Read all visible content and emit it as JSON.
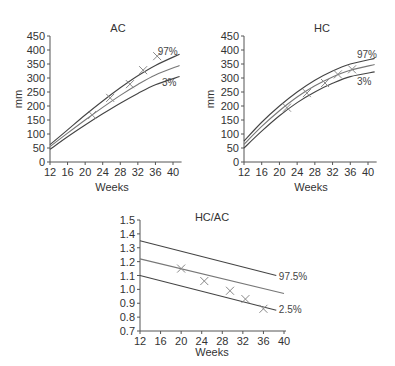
{
  "chart_data": [
    {
      "type": "line",
      "title": "AC",
      "xlabel": "Weeks",
      "ylabel": "mm",
      "xlim": [
        12,
        41.5
      ],
      "ylim": [
        0,
        450
      ],
      "x_ticks": [
        12,
        16,
        20,
        24,
        28,
        32,
        36,
        40
      ],
      "y_ticks": [
        0,
        50,
        100,
        150,
        200,
        250,
        300,
        350,
        400,
        450
      ],
      "grid": false,
      "series": [
        {
          "name": "97%",
          "x": [
            12,
            16,
            20,
            24,
            28,
            32,
            36,
            41.5
          ],
          "values": [
            62,
            115,
            168,
            218,
            265,
            308,
            345,
            385
          ]
        },
        {
          "name": "50%",
          "x": [
            12,
            16,
            20,
            24,
            28,
            32,
            36,
            41.5
          ],
          "values": [
            55,
            103,
            150,
            195,
            238,
            277,
            311,
            345
          ]
        },
        {
          "name": "3%",
          "x": [
            12,
            16,
            20,
            24,
            28,
            32,
            36,
            41.5
          ],
          "values": [
            45,
            90,
            132,
            172,
            210,
            245,
            276,
            305
          ]
        }
      ],
      "points": {
        "name": "measurements",
        "x": [
          21.6,
          25.7,
          30.2,
          33.2,
          36.4
        ],
        "values": [
          168,
          229,
          278,
          328,
          378
        ]
      },
      "annotations": [
        {
          "text": "97%",
          "x": 36.5,
          "y": 398
        },
        {
          "text": "3%",
          "x": 37.5,
          "y": 285
        }
      ]
    },
    {
      "type": "line",
      "title": "HC",
      "xlabel": "Weeks",
      "ylabel": "mm",
      "xlim": [
        12,
        41.5
      ],
      "ylim": [
        0,
        450
      ],
      "x_ticks": [
        12,
        16,
        20,
        24,
        28,
        32,
        36,
        40
      ],
      "y_ticks": [
        0,
        50,
        100,
        150,
        200,
        250,
        300,
        350,
        400,
        450
      ],
      "grid": false,
      "series": [
        {
          "name": "97%",
          "x": [
            12,
            16,
            20,
            24,
            28,
            32,
            36,
            41.5
          ],
          "values": [
            75,
            142,
            200,
            250,
            292,
            325,
            350,
            370
          ]
        },
        {
          "name": "50%",
          "x": [
            12,
            16,
            20,
            24,
            28,
            32,
            36,
            41.5
          ],
          "values": [
            63,
            127,
            183,
            232,
            272,
            304,
            328,
            348
          ]
        },
        {
          "name": "3%",
          "x": [
            12,
            16,
            20,
            24,
            28,
            32,
            36,
            41.5
          ],
          "values": [
            50,
            110,
            165,
            212,
            250,
            281,
            305,
            322
          ]
        }
      ],
      "points": {
        "name": "measurements",
        "x": [
          21.7,
          26.2,
          30.3,
          33.2,
          36.4
        ],
        "values": [
          194,
          246,
          282,
          313,
          331
        ]
      },
      "annotations": [
        {
          "text": "97%",
          "x": 37.5,
          "y": 385
        },
        {
          "text": "3%",
          "x": 37.5,
          "y": 290
        }
      ]
    },
    {
      "type": "line",
      "title": "HC/AC",
      "xlabel": "Weeks",
      "ylabel": "",
      "xlim": [
        12,
        40
      ],
      "ylim": [
        0.7,
        1.5
      ],
      "x_ticks": [
        12,
        16,
        20,
        24,
        28,
        32,
        36,
        40
      ],
      "y_ticks": [
        "0.7",
        "0.8",
        "0.9",
        "1.0",
        "1.1",
        "1.2",
        "1.3",
        "1.4",
        "1.5"
      ],
      "grid": false,
      "series": [
        {
          "name": "97.5%",
          "x": [
            12,
            38.5
          ],
          "values": [
            1.35,
            1.1
          ]
        },
        {
          "name": "50%",
          "x": [
            12,
            40
          ],
          "values": [
            1.22,
            0.97
          ]
        },
        {
          "name": "2.5%",
          "x": [
            12,
            38.5
          ],
          "values": [
            1.1,
            0.85
          ]
        }
      ],
      "points": {
        "name": "measurements",
        "x": [
          20,
          24.5,
          29.5,
          32.5,
          36
        ],
        "values": [
          1.15,
          1.06,
          0.99,
          0.93,
          0.86
        ]
      },
      "annotations": [
        {
          "text": "97.5%",
          "x": 39,
          "y": 1.1
        },
        {
          "text": "2.5%",
          "x": 39,
          "y": 0.86
        }
      ]
    }
  ],
  "panels": [
    {
      "title": "AC",
      "xlabel": "Weeks",
      "ylabel": "mm"
    },
    {
      "title": "HC",
      "xlabel": "Weeks",
      "ylabel": "mm"
    },
    {
      "title": "HC/AC",
      "xlabel": "Weeks"
    }
  ],
  "colors": {
    "axis": "#555555",
    "curve": "#444444",
    "median_curve": "#777777",
    "marker": "#888888",
    "text": "#333333"
  }
}
